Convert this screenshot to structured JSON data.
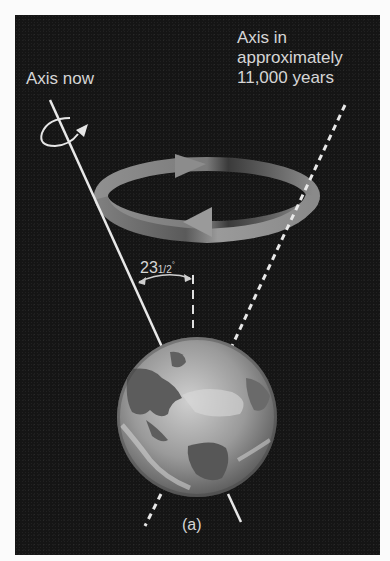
{
  "figure": {
    "labels": {
      "axis_now": "Axis now",
      "axis_future_lines": [
        "Axis in",
        "approximately",
        "11,000 years"
      ],
      "tilt_angle_main": "23",
      "tilt_angle_fraction": "1/2",
      "tilt_angle_unit": "°",
      "caption": "(a)"
    },
    "elements": {
      "earth": "earth-globe",
      "current_axis": "solid-line",
      "future_axis": "dashed-line",
      "precession_arrow": "circular-ring-arrows",
      "spin_arrow": "small-curved-arrow"
    },
    "colors": {
      "background": "#151515",
      "page": "#fbfbfb",
      "text": "#d6d6d6",
      "ring": "#8a8a8a",
      "lines": "#e8e8e8"
    }
  }
}
